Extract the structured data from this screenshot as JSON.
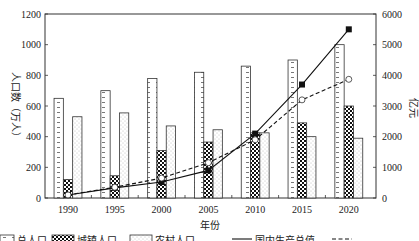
{
  "chart_data": {
    "type": "bar",
    "title": "",
    "xlabel": "年份",
    "ylabel": "人口数（万人）",
    "y2label": "亿元",
    "ylim": [
      0,
      1200
    ],
    "y2lim": [
      0,
      6000
    ],
    "yticks": [
      0,
      200,
      400,
      600,
      800,
      1000,
      1200
    ],
    "y2ticks": [
      0,
      1000,
      2000,
      3000,
      4000,
      5000,
      6000
    ],
    "grid": false,
    "legend_position": "bottom",
    "categories": [
      "1990",
      "1995",
      "2000",
      "2005",
      "2010",
      "2015",
      "2020"
    ],
    "series": [
      {
        "name": "总人口",
        "type": "bar",
        "axis": "left",
        "pattern": "dashed-stripes",
        "values": [
          650,
          700,
          780,
          820,
          860,
          900,
          1000
        ]
      },
      {
        "name": "城镇人口",
        "type": "bar",
        "axis": "left",
        "pattern": "checker",
        "values": [
          120,
          145,
          310,
          365,
          425,
          490,
          600
        ]
      },
      {
        "name": "农村人口",
        "type": "bar",
        "axis": "left",
        "pattern": "dots",
        "values": [
          530,
          555,
          470,
          445,
          425,
          400,
          390
        ]
      },
      {
        "name": "国内生产总值",
        "type": "line",
        "axis": "right",
        "style": "solid",
        "marker": "filled-square",
        "values": [
          100,
          330,
          520,
          900,
          2100,
          3700,
          5500
        ]
      },
      {
        "name": "",
        "type": "line",
        "axis": "right",
        "style": "dashed",
        "marker": "open-circle",
        "values": [
          100,
          350,
          650,
          1150,
          1900,
          3200,
          3870
        ]
      }
    ]
  },
  "legend": {
    "items": [
      "总人口",
      "城镇人口",
      "农村人口",
      "国内生产总值",
      ""
    ]
  }
}
